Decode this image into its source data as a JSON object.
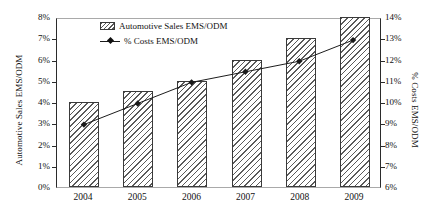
{
  "chart_data": {
    "type": "bar",
    "title": "",
    "xlabel": "",
    "categories": [
      "2004",
      "2005",
      "2006",
      "2007",
      "2008",
      "2009"
    ],
    "grid": false,
    "legend_position": "top-center",
    "series": [
      {
        "name": "Automotive Sales EMS/ODM",
        "type": "bar",
        "axis": "left",
        "values": [
          4.0,
          4.5,
          5.0,
          6.0,
          7.0,
          8.0
        ],
        "value_labels": [
          "4%",
          "4.5%",
          "5%",
          "6%",
          "7%",
          "8%"
        ]
      },
      {
        "name": "% Costs EMS/ODM",
        "type": "line",
        "axis": "right",
        "marker": "diamond",
        "values": [
          9.0,
          10.0,
          11.0,
          11.5,
          12.0,
          13.0
        ],
        "value_labels": [
          "9%",
          "10%",
          "11%",
          "11.5%",
          "12%",
          "13%"
        ]
      }
    ],
    "left_axis": {
      "label": "Automotive Sales EMS/ODM",
      "ylim": [
        0,
        8
      ],
      "tick_step": 1,
      "ticks": [
        "0%",
        "1%",
        "2%",
        "3%",
        "4%",
        "5%",
        "6%",
        "7%",
        "8%"
      ]
    },
    "right_axis": {
      "label": "% Costs EMS/ODM",
      "ylim": [
        6,
        14
      ],
      "tick_step": 1,
      "ticks": [
        "6%",
        "7%",
        "8%",
        "9%",
        "10%",
        "11%",
        "12%",
        "13%",
        "14%"
      ]
    },
    "legend": [
      {
        "label": "Automotive Sales EMS/ODM",
        "marker": "hatched-swatch"
      },
      {
        "label": "% Costs EMS/ODM",
        "marker": "line-with-diamond"
      }
    ],
    "colors": {
      "bar_hatch": "#5a5a5a",
      "bar_fill": "#ffffff",
      "bar_border": "#3a3a3a",
      "line": "#1a1a1a",
      "axis": "#2b2b2b",
      "frame_light": "#a9a9a9",
      "background": "#ffffff"
    }
  }
}
